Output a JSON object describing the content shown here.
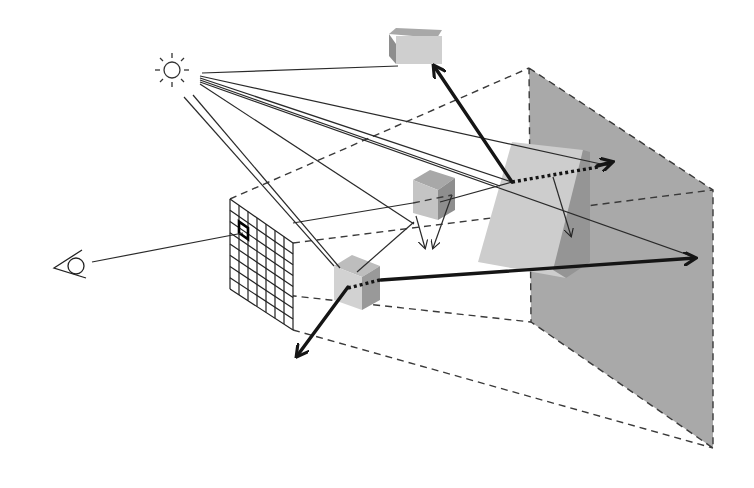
{
  "diagram": {
    "type": "ray-tracing-illustration",
    "colors": {
      "background": "#ffffff",
      "shadow_plane": "#a9a9a9",
      "box_light": "#cfcfcf",
      "box_mid": "#b4b4b4",
      "box_dark": "#8e8e8e",
      "glass_light": "#cdcdcd",
      "glass_dark": "#959595",
      "line": "#222222"
    },
    "light_source": {
      "icon": "sun-icon",
      "center": [
        172,
        70
      ],
      "radius": 10
    },
    "eye": {
      "icon": "eye-icon",
      "center": [
        76,
        266
      ]
    },
    "image_grid": {
      "label": "pixel-grid",
      "rows": 8,
      "cols": 7,
      "corners": {
        "tl": [
          230,
          199
        ],
        "tr": [
          293,
          243
        ],
        "br": [
          293,
          330
        ],
        "bl": [
          230,
          289
        ]
      },
      "highlighted_cell": [
        1,
        1
      ]
    },
    "objects": [
      {
        "name": "top-box",
        "center": [
          414,
          44
        ]
      },
      {
        "name": "middle-cube",
        "center": [
          434,
          194
        ]
      },
      {
        "name": "front-cube",
        "center": [
          358,
          283
        ]
      },
      {
        "name": "glass-slab",
        "center": [
          548,
          210
        ]
      }
    ],
    "back_plane": {
      "corners": [
        [
          529,
          68
        ],
        [
          713,
          190
        ],
        [
          713,
          448
        ],
        [
          531,
          322
        ]
      ]
    },
    "frustum_edges": [
      [
        [
          230,
          199
        ],
        [
          529,
          68
        ]
      ],
      [
        [
          293,
          243
        ],
        [
          713,
          190
        ]
      ],
      [
        [
          293,
          330
        ],
        [
          713,
          448
        ]
      ],
      [
        [
          230,
          289
        ],
        [
          531,
          322
        ]
      ]
    ],
    "primary_ray": {
      "from": [
        90,
        262
      ],
      "to": [
        250,
        233
      ]
    },
    "shadow_rays": [
      [
        [
          202,
          73
        ],
        [
          398,
          65
        ]
      ],
      [
        [
          200,
          76
        ],
        [
          555,
          150
        ]
      ],
      [
        [
          200,
          78
        ],
        [
          610,
          168
        ]
      ],
      [
        [
          200,
          80
        ],
        [
          512,
          182
        ]
      ],
      [
        [
          200,
          82
        ],
        [
          500,
          186
        ]
      ],
      [
        [
          200,
          84
        ],
        [
          697,
          258
        ]
      ],
      [
        [
          200,
          86
        ],
        [
          414,
          224
        ]
      ],
      [
        [
          193,
          95
        ],
        [
          340,
          268
        ]
      ],
      [
        [
          182,
          96
        ],
        [
          334,
          266
        ]
      ]
    ],
    "reflection_arrows": [
      {
        "from": [
          512,
          182
        ],
        "to": [
          433,
          64
        ]
      },
      {
        "from": [
          598,
          165
        ],
        "to": [
          614,
          160
        ]
      },
      {
        "from": [
          348,
          286
        ],
        "to": [
          296,
          357
        ]
      },
      {
        "from": [
          400,
          282
        ],
        "to": [
          697,
          258
        ]
      }
    ]
  }
}
